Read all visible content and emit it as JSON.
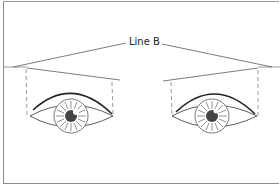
{
  "diagram": {
    "label": "Line B",
    "elements": [
      "left-eye",
      "right-eye",
      "left-brow-guide",
      "right-brow-guide",
      "line-b"
    ],
    "colors": {
      "stroke": "#333333",
      "pupil": "#444444",
      "frame": "#8a8a8a"
    }
  }
}
